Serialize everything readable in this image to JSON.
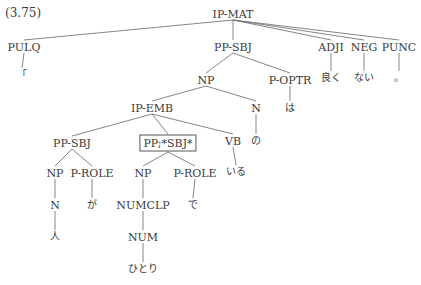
{
  "example_number": "(3.75)",
  "tree": {
    "nodes": [
      {
        "id": "ipmat",
        "label": "IP-MAT",
        "x": 233,
        "y": 14
      },
      {
        "id": "pulq",
        "label": "PULQ",
        "x": 24,
        "y": 47
      },
      {
        "id": "q",
        "label": "「",
        "x": 22,
        "y": 75,
        "jp": true
      },
      {
        "id": "ppsbj1",
        "label": "PP-SBJ",
        "x": 233,
        "y": 47
      },
      {
        "id": "adji",
        "label": "ADJI",
        "x": 331,
        "y": 47
      },
      {
        "id": "neg",
        "label": "NEG",
        "x": 364,
        "y": 47
      },
      {
        "id": "punc",
        "label": "PUNC",
        "x": 399,
        "y": 47
      },
      {
        "id": "yoku",
        "label": "良く",
        "x": 331,
        "y": 78,
        "jp": true
      },
      {
        "id": "nai",
        "label": "ない",
        "x": 364,
        "y": 78,
        "jp": true
      },
      {
        "id": "maru",
        "label": "。",
        "x": 399,
        "y": 78,
        "jp": true
      },
      {
        "id": "np1",
        "label": "NP",
        "x": 206,
        "y": 80
      },
      {
        "id": "poptr",
        "label": "P-OPTR",
        "x": 290,
        "y": 80
      },
      {
        "id": "wa",
        "label": "は",
        "x": 290,
        "y": 108,
        "jp": true
      },
      {
        "id": "ipemb",
        "label": "IP-EMB",
        "x": 152,
        "y": 108
      },
      {
        "id": "n1",
        "label": "N",
        "x": 256,
        "y": 108
      },
      {
        "id": "no",
        "label": "の",
        "x": 256,
        "y": 141,
        "jp": true
      },
      {
        "id": "ppsbj2",
        "label": "PP-SBJ",
        "x": 72,
        "y": 143
      },
      {
        "id": "ppbox",
        "label": "PP;*SBJ*",
        "x": 168,
        "y": 143,
        "boxed": true
      },
      {
        "id": "vb",
        "label": "VB",
        "x": 233,
        "y": 141
      },
      {
        "id": "iru",
        "label": "いる",
        "x": 236,
        "y": 172,
        "jp": true
      },
      {
        "id": "np2",
        "label": "NP",
        "x": 55,
        "y": 173
      },
      {
        "id": "prole1",
        "label": "P-ROLE",
        "x": 92,
        "y": 173
      },
      {
        "id": "np3",
        "label": "NP",
        "x": 143,
        "y": 173
      },
      {
        "id": "prole2",
        "label": "P-ROLE",
        "x": 195,
        "y": 173
      },
      {
        "id": "n2",
        "label": "N",
        "x": 55,
        "y": 205
      },
      {
        "id": "ga",
        "label": "が",
        "x": 92,
        "y": 205,
        "jp": true
      },
      {
        "id": "numclp",
        "label": "NUMCLP",
        "x": 143,
        "y": 205
      },
      {
        "id": "de",
        "label": "で",
        "x": 193,
        "y": 205,
        "jp": true
      },
      {
        "id": "hito",
        "label": "人",
        "x": 55,
        "y": 237,
        "jp": true
      },
      {
        "id": "num",
        "label": "NUM",
        "x": 143,
        "y": 237
      },
      {
        "id": "hitori",
        "label": "ひとり",
        "x": 143,
        "y": 269,
        "jp": true
      }
    ],
    "edges": [
      [
        "ipmat",
        "pulq"
      ],
      [
        "ipmat",
        "ppsbj1"
      ],
      [
        "ipmat",
        "adji"
      ],
      [
        "ipmat",
        "neg"
      ],
      [
        "ipmat",
        "punc"
      ],
      [
        "pulq",
        "q"
      ],
      [
        "adji",
        "yoku"
      ],
      [
        "neg",
        "nai"
      ],
      [
        "punc",
        "maru"
      ],
      [
        "ppsbj1",
        "np1"
      ],
      [
        "ppsbj1",
        "poptr"
      ],
      [
        "poptr",
        "wa"
      ],
      [
        "np1",
        "ipemb"
      ],
      [
        "np1",
        "n1"
      ],
      [
        "n1",
        "no"
      ],
      [
        "ipemb",
        "ppsbj2"
      ],
      [
        "ipemb",
        "ppbox"
      ],
      [
        "ipemb",
        "vb"
      ],
      [
        "vb",
        "iru"
      ],
      [
        "ppsbj2",
        "np2"
      ],
      [
        "ppsbj2",
        "prole1"
      ],
      [
        "np2",
        "n2"
      ],
      [
        "n2",
        "hito"
      ],
      [
        "prole1",
        "ga"
      ],
      [
        "ppbox",
        "np3"
      ],
      [
        "ppbox",
        "prole2"
      ],
      [
        "np3",
        "numclp"
      ],
      [
        "numclp",
        "num"
      ],
      [
        "num",
        "hitori"
      ],
      [
        "prole2",
        "de"
      ]
    ]
  }
}
